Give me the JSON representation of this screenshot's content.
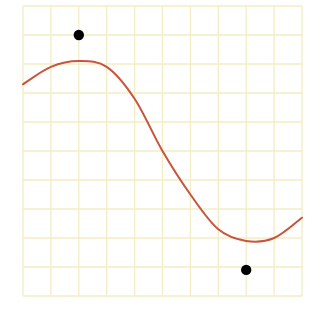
{
  "colors": {
    "background": "#ffffff",
    "grid": "#f3edc4",
    "curve": "#c8553b",
    "points": "#000000"
  },
  "chart_data": {
    "type": "scatter",
    "title": "",
    "xlabel": "",
    "ylabel": "",
    "grid": true,
    "xlim": [
      0,
      10
    ],
    "ylim": [
      0,
      10
    ],
    "grid_cells": [
      10,
      10
    ],
    "series": [
      {
        "name": "curve",
        "kind": "line",
        "x": [
          0,
          1,
          2,
          3,
          4,
          5,
          6,
          7,
          8,
          9,
          10
        ],
        "y": [
          7.3,
          7.9,
          8.1,
          7.9,
          6.8,
          5.0,
          3.5,
          2.3,
          1.9,
          2.0,
          2.7
        ]
      },
      {
        "name": "points",
        "kind": "scatter",
        "x": [
          2,
          8
        ],
        "y": [
          9.0,
          0.9
        ]
      }
    ]
  }
}
